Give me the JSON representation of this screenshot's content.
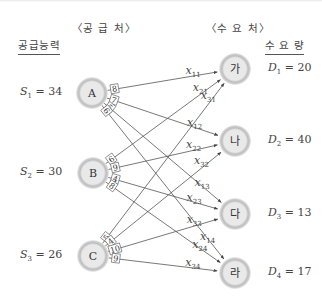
{
  "headers": {
    "supply": "〈공 급 처〉",
    "demand": "〈수 요 처〉",
    "capacity": "공급능력",
    "quantity": "수 요 량"
  },
  "supply_nodes": [
    {
      "id": "A",
      "label": "A",
      "s_var": "S",
      "s_sub": "1",
      "s_value": "34",
      "x": 92,
      "y": 93
    },
    {
      "id": "B",
      "label": "B",
      "s_var": "S",
      "s_sub": "2",
      "s_value": "30",
      "x": 93,
      "y": 173
    },
    {
      "id": "C",
      "label": "C",
      "s_var": "S",
      "s_sub": "3",
      "s_value": "26",
      "x": 93,
      "y": 256
    }
  ],
  "demand_nodes": [
    {
      "id": "ga",
      "label": "가",
      "d_var": "D",
      "d_sub": "1",
      "d_value": "20",
      "x": 235,
      "y": 69
    },
    {
      "id": "na",
      "label": "나",
      "d_var": "D",
      "d_sub": "2",
      "d_value": "40",
      "x": 235,
      "y": 141
    },
    {
      "id": "da",
      "label": "다",
      "d_var": "D",
      "d_sub": "3",
      "d_value": "13",
      "x": 235,
      "y": 214
    },
    {
      "id": "ra",
      "label": "라",
      "d_var": "D",
      "d_sub": "4",
      "d_value": "17",
      "x": 235,
      "y": 273
    }
  ],
  "edges": [
    {
      "from": "A",
      "to": "가",
      "cost": "8",
      "var": "x",
      "sub": "11"
    },
    {
      "from": "A",
      "to": "나",
      "cost": "7",
      "var": "x",
      "sub": "12"
    },
    {
      "from": "A",
      "to": "다",
      "cost": "5",
      "var": "x",
      "sub": "13"
    },
    {
      "from": "A",
      "to": "라",
      "cost": "6",
      "var": "x",
      "sub": "14"
    },
    {
      "from": "B",
      "to": "가",
      "cost": "6",
      "var": "x",
      "sub": "21"
    },
    {
      "from": "B",
      "to": "나",
      "cost": "9",
      "var": "x",
      "sub": "22"
    },
    {
      "from": "B",
      "to": "다",
      "cost": "4",
      "var": "x",
      "sub": "23"
    },
    {
      "from": "B",
      "to": "라",
      "cost": "8",
      "var": "x",
      "sub": "24"
    },
    {
      "from": "C",
      "to": "가",
      "cost": "5",
      "var": "x",
      "sub": "31"
    },
    {
      "from": "C",
      "to": "나",
      "cost": "4",
      "var": "x",
      "sub": "32"
    },
    {
      "from": "C",
      "to": "다",
      "cost": "10",
      "var": "x",
      "sub": "33"
    },
    {
      "from": "C",
      "to": "라",
      "cost": "9",
      "var": "x",
      "sub": "34"
    }
  ],
  "colors": {
    "node_fill": "#e6e6e6",
    "node_ring": "#b5b5b5",
    "edge": "#555555",
    "text": "#444444"
  }
}
